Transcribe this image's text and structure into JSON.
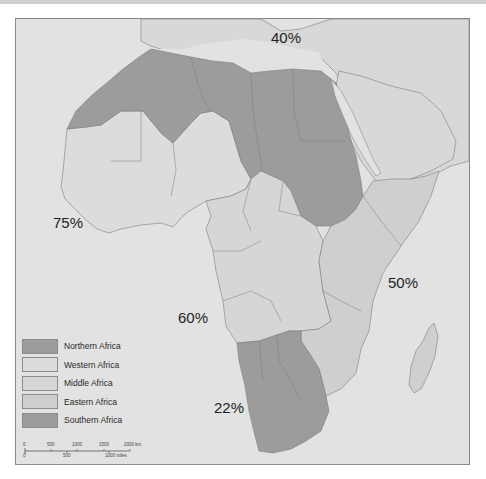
{
  "map": {
    "title": "",
    "labels": {
      "northern": "40%",
      "western": "75%",
      "middle": "60%",
      "eastern": "50%",
      "southern": "22%"
    }
  },
  "legend": {
    "items": [
      {
        "label": "Northern Africa",
        "color": "#9c9c9c"
      },
      {
        "label": "Western Africa",
        "color": "#dcdcdc"
      },
      {
        "label": "Middle Africa",
        "color": "#d6d6d6"
      },
      {
        "label": "Eastern Africa",
        "color": "#cfcfcf"
      },
      {
        "label": "Southern Africa",
        "color": "#9c9c9c"
      }
    ]
  },
  "scale": {
    "km_ticks": [
      "0",
      "500",
      "1000",
      "1500",
      "2000 km"
    ],
    "mile_ticks": [
      "0",
      "500",
      "1000 miles"
    ]
  },
  "colors": {
    "ocean": "#e2e2e2",
    "land_other": "#d8d8d8",
    "border": "#7d7d7d",
    "dark_region": "#9c9c9c"
  }
}
